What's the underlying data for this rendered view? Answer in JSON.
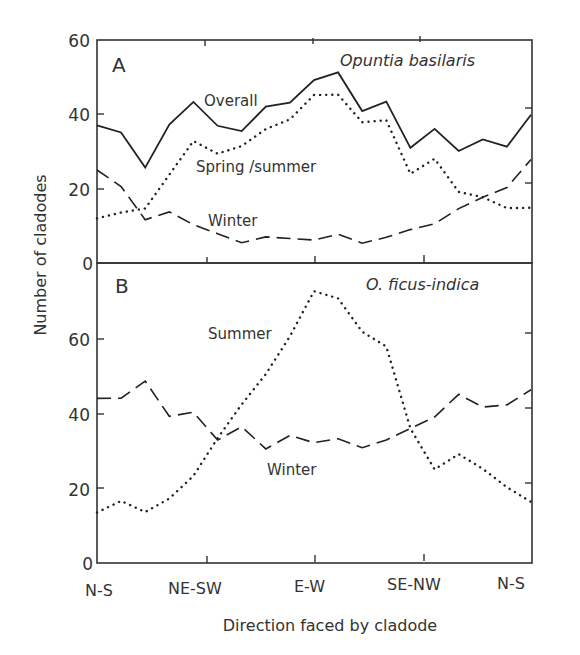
{
  "chart_data": [
    {
      "panel": "A",
      "type": "line",
      "title": "Opuntia basilaris",
      "panel_label": "A",
      "xlabel": "Direction faced by cladode",
      "ylabel": "Number of cladodes",
      "ylim": [
        0,
        60
      ],
      "yticks": [
        0,
        20,
        40,
        60
      ],
      "x_tick_labels": [
        "N-S",
        "NE-SW",
        "E-W",
        "SE-NW",
        "N-S"
      ],
      "n_points": 19,
      "grid": false,
      "series": [
        {
          "name": "Overall",
          "style": "solid",
          "values": [
            37,
            35,
            25.5,
            37,
            43,
            36.5,
            35,
            41.5,
            42.5,
            48.5,
            50.5,
            40,
            42.5,
            30,
            35,
            29,
            32,
            30,
            38.5
          ]
        },
        {
          "name": "Spring/summer",
          "style": "dotted",
          "values": [
            12,
            13.5,
            14.5,
            23.5,
            32.5,
            29,
            31,
            35.5,
            38,
            44.5,
            44.5,
            37,
            37.5,
            23,
            27,
            18,
            16.5,
            13.5,
            13.5
          ]
        },
        {
          "name": "Winter",
          "style": "dashed",
          "values": [
            25,
            20.5,
            11.5,
            13.5,
            10,
            7.5,
            5,
            6.5,
            6,
            5.5,
            7,
            4.5,
            6,
            8,
            9.5,
            13.5,
            16.5,
            19,
            26.5
          ]
        }
      ],
      "annotations": [
        {
          "text": "Overall",
          "near_series": "Overall"
        },
        {
          "text": "Spring /summer",
          "near_series": "Spring/summer"
        },
        {
          "text": "Winter",
          "near_series": "Winter"
        }
      ]
    },
    {
      "panel": "B",
      "type": "line",
      "title": "O. ficus-indica",
      "panel_label": "B",
      "xlabel": "Direction faced by cladode",
      "ylabel": "Number of cladodes",
      "ylim": [
        0,
        80
      ],
      "yticks": [
        0,
        20,
        40,
        60
      ],
      "x_tick_labels": [
        "N-S",
        "NE-SW",
        "E-W",
        "SE-NW",
        "N-S"
      ],
      "n_points": 19,
      "grid": false,
      "series": [
        {
          "name": "Summer",
          "style": "dotted",
          "values": [
            13.5,
            16.5,
            13.5,
            17,
            23,
            33,
            42,
            50,
            60,
            72,
            70,
            61,
            57,
            35,
            24,
            28,
            24,
            19,
            15
          ]
        },
        {
          "name": "Winter",
          "style": "dashed",
          "values": [
            44,
            44,
            48.5,
            39,
            40,
            32.5,
            36,
            30,
            33.5,
            31.5,
            32.5,
            30,
            32,
            35,
            38,
            44,
            40.5,
            41,
            45
          ]
        }
      ],
      "annotations": [
        {
          "text": "Summer",
          "near_series": "Summer"
        },
        {
          "text": "Winter",
          "near_series": "Winter"
        }
      ]
    }
  ],
  "labels": {
    "panel_a_letter": "A",
    "panel_b_letter": "B",
    "panel_a_species": "Opuntia basilaris",
    "panel_b_species": "O. ficus-indica",
    "a_overall": "Overall",
    "a_spring_summer": "Spring /summer",
    "a_winter": "Winter",
    "b_summer": "Summer",
    "b_winter": "Winter",
    "ylabel": "Number of cladodes",
    "xlabel": "Direction faced by cladode",
    "a_yticks": [
      "60",
      "40",
      "20",
      "0"
    ],
    "b_yticks": [
      "60",
      "40",
      "20",
      "0"
    ],
    "xticks": [
      "N-S",
      "NE-SW",
      "E-W",
      "SE-NW",
      "N-S"
    ]
  }
}
